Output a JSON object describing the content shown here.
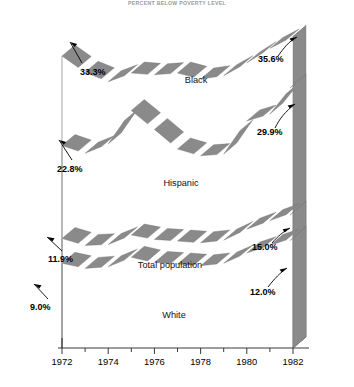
{
  "title": "PERCENT BELOW POVERTY LEVEL",
  "chart_data": {
    "type": "line",
    "style": "3d-ribbon-band",
    "title": "PERCENT BELOW POVERTY LEVEL",
    "xlabel": "",
    "ylabel": "",
    "x": [
      1972,
      1973,
      1974,
      1975,
      1976,
      1977,
      1978,
      1979,
      1980,
      1981,
      1982
    ],
    "xticks": [
      "1972",
      "1974",
      "1976",
      "1978",
      "1980",
      "1982"
    ],
    "xlim": [
      1972,
      1982
    ],
    "ylim": [
      0,
      38
    ],
    "grid": false,
    "legend": "inline-labels",
    "series": [
      {
        "name": "Black",
        "values": [
          33.3,
          31.4,
          30.3,
          31.3,
          31.1,
          31.3,
          30.6,
          31.0,
          32.5,
          34.2,
          35.6
        ],
        "start_label": "33.3%",
        "end_label": "35.6%"
      },
      {
        "name": "Hispanic",
        "values": [
          22.8,
          21.9,
          23.0,
          26.9,
          24.7,
          22.4,
          21.6,
          21.8,
          25.7,
          26.5,
          29.9
        ],
        "start_label": "22.8%",
        "end_label": "29.9%"
      },
      {
        "name": "Total population",
        "values": [
          11.9,
          11.1,
          11.2,
          12.3,
          11.8,
          11.6,
          11.4,
          11.7,
          13.0,
          14.0,
          15.0
        ],
        "start_label": "11.9%",
        "end_label": "15.0%"
      },
      {
        "name": "White",
        "values": [
          9.0,
          8.4,
          8.6,
          9.7,
          9.1,
          8.9,
          8.7,
          9.0,
          10.2,
          11.1,
          12.0
        ],
        "start_label": "9.0%",
        "end_label": "12.0%"
      }
    ]
  },
  "labels": {
    "black": "Black",
    "hispanic": "Hispanic",
    "total": "Total population",
    "white": "White"
  },
  "values": {
    "black_start": "33.3%",
    "black_end": "35.6%",
    "hispanic_start": "22.8%",
    "hispanic_end": "29.9%",
    "total_start": "11.9%",
    "total_end": "15.0%",
    "white_start": "9.0%",
    "white_end": "12.0%"
  },
  "axis": {
    "ticks": [
      "1972",
      "1974",
      "1976",
      "1978",
      "1980",
      "1982"
    ]
  },
  "colors": {
    "ribbon_fill": "#8a8a8a",
    "ribbon_edge": "#6f6f6f",
    "wall_top": "#a8a8a8",
    "axis": "#3a3a3a",
    "text": "#000000",
    "title": "#9a9aa2",
    "dropline": "#9b9b9b"
  }
}
